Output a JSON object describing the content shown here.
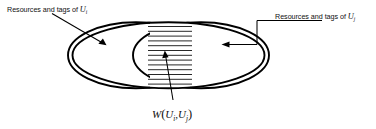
{
  "figure": {
    "type": "venn-diagram",
    "background_color": "#ffffff",
    "stroke_color": "#000000",
    "text_color": "#111111"
  },
  "labels": {
    "left": {
      "prefix": "Resources and tags of ",
      "variable": "U",
      "subscript": "i"
    },
    "right": {
      "prefix": "Resources and tags of ",
      "variable": "U",
      "subscript": "j"
    },
    "intersection": {
      "function": "W",
      "open_paren": "(",
      "arg1_variable": "U",
      "arg1_subscript": "i",
      "separator": ",",
      "arg2_variable": "U",
      "arg2_subscript": "j",
      "close_paren": ")"
    }
  },
  "regions": {
    "left_set": "Resources and tags of Ui",
    "right_set": "Resources and tags of Uj",
    "overlap": "W(Ui, Uj)",
    "overlap_fill": "horizontal-hatch",
    "hatch_line_count": 13
  },
  "annotations": {
    "left_arrow": "points down-right into left ellipse",
    "right_arrow": "points left into right ellipse",
    "bottom_arrow": "points up into hatched intersection"
  }
}
